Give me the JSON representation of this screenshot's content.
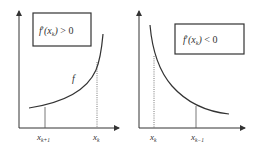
{
  "panels": [
    {
      "id": "increasing",
      "condition_label": "f′(x_k) > 0",
      "condition_parts": {
        "f": "f",
        "prime": "′",
        "arg": "(x",
        "sub": "k",
        "close": ")",
        "rel": " > 0"
      },
      "curve_label": "f",
      "x_ticks": [
        {
          "base": "x",
          "sub": "k+1"
        },
        {
          "base": "x",
          "sub": "k"
        }
      ]
    },
    {
      "id": "decreasing",
      "condition_label": "f′(x_k) < 0",
      "condition_parts": {
        "f": "f",
        "prime": "′",
        "arg": "(x",
        "sub": "k",
        "close": ")",
        "rel": " < 0"
      },
      "x_ticks": [
        {
          "base": "x",
          "sub": "k"
        },
        {
          "base": "x",
          "sub": "k−1"
        }
      ]
    }
  ],
  "colors": {
    "stroke": "#333333",
    "background": "#ffffff"
  }
}
